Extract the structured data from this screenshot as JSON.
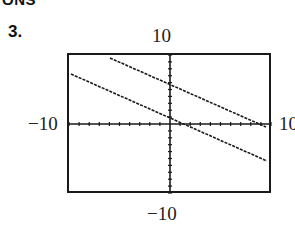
{
  "header": {
    "cut_text": "ONS"
  },
  "problem": {
    "number": "3."
  },
  "window": {
    "ymax_label": "10",
    "ymin_label": "−10",
    "xmin_label": "−10",
    "xmax_label": "10"
  },
  "chart_data": {
    "type": "line",
    "title": "",
    "xlabel": "",
    "ylabel": "",
    "xlim": [
      -10,
      10
    ],
    "ylim": [
      -10,
      10
    ],
    "ticks": {
      "x_step": 1,
      "y_step": 1
    },
    "grid": false,
    "legend": null,
    "series": [
      {
        "name": "upper line",
        "x": [
          -6,
          10
        ],
        "y": [
          10,
          -0.7
        ],
        "approx_equation": "y = -2/3 x + 6",
        "style": "dashed-pixel"
      },
      {
        "name": "lower line",
        "x": [
          -10,
          10
        ],
        "y": [
          7.6,
          -5.5
        ],
        "approx_equation": "y = -2/3 x + 1",
        "style": "dashed-pixel"
      }
    ],
    "annotations": [
      "10",
      "−10",
      "−10",
      "10"
    ]
  }
}
